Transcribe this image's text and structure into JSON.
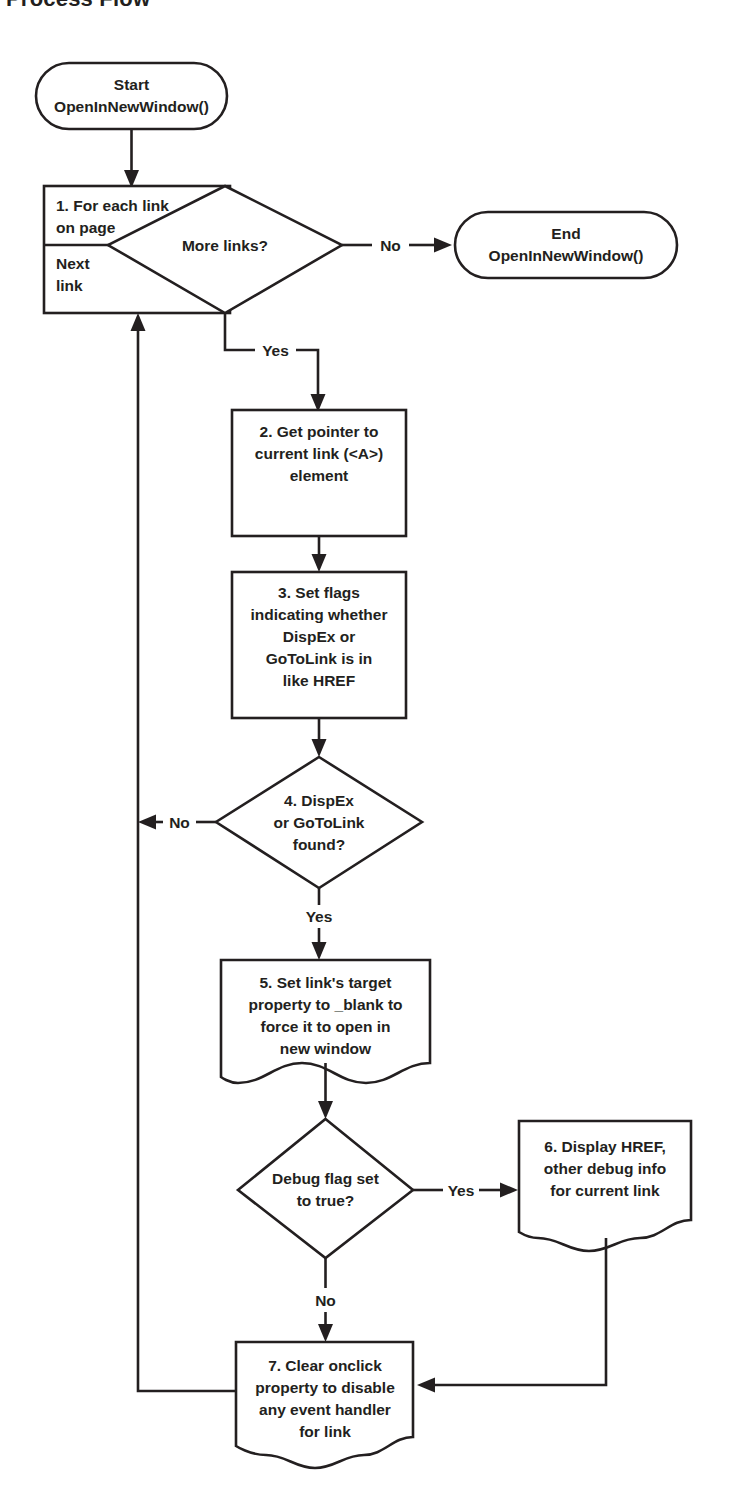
{
  "title": "Process Flow",
  "diagram": {
    "type": "flowchart",
    "orientation": "top-to-bottom",
    "nodes": [
      {
        "id": "start",
        "shape": "terminator",
        "lines": [
          "Start",
          "OpenInNewWindow()"
        ]
      },
      {
        "id": "loop",
        "shape": "loop-box",
        "header_lines": [
          "1. For each link",
          "on page"
        ],
        "footer_lines": [
          "Next",
          "link"
        ]
      },
      {
        "id": "more-links",
        "shape": "decision",
        "lines": [
          "More links?"
        ]
      },
      {
        "id": "end",
        "shape": "terminator",
        "lines": [
          "End",
          "OpenInNewWindow()"
        ]
      },
      {
        "id": "step2",
        "shape": "process",
        "lines": [
          "2. Get pointer to",
          "current link (<A>)",
          "element"
        ]
      },
      {
        "id": "step3",
        "shape": "process",
        "lines": [
          "3. Set flags",
          "indicating whether",
          "DispEx or",
          "GoToLink is in",
          "like HREF"
        ]
      },
      {
        "id": "step4",
        "shape": "decision",
        "lines": [
          "4. DispEx",
          "or GoToLink",
          "found?"
        ]
      },
      {
        "id": "step5",
        "shape": "document",
        "lines": [
          "5. Set link's target",
          "property to _blank to",
          "force it to open in",
          "new window"
        ]
      },
      {
        "id": "debug-flag",
        "shape": "decision",
        "lines": [
          "Debug flag set",
          "to true?"
        ]
      },
      {
        "id": "step6",
        "shape": "document",
        "lines": [
          "6. Display HREF,",
          "other debug info",
          "for current link"
        ]
      },
      {
        "id": "step7",
        "shape": "document",
        "lines": [
          "7. Clear onclick",
          "property to disable",
          "any event handler",
          "for link"
        ]
      }
    ],
    "edges": [
      {
        "id": "e-start-loop",
        "from": "start",
        "to": "loop",
        "label": ""
      },
      {
        "id": "e-more-no",
        "from": "more-links",
        "to": "end",
        "label": "No"
      },
      {
        "id": "e-more-yes",
        "from": "more-links",
        "to": "step2",
        "label": "Yes"
      },
      {
        "id": "e-2-3",
        "from": "step2",
        "to": "step3",
        "label": ""
      },
      {
        "id": "e-3-4",
        "from": "step3",
        "to": "step4",
        "label": ""
      },
      {
        "id": "e-4-no",
        "from": "step4",
        "to": "loop",
        "label": "No"
      },
      {
        "id": "e-4-yes",
        "from": "step4",
        "to": "step5",
        "label": "Yes"
      },
      {
        "id": "e-5-debug",
        "from": "step5",
        "to": "debug-flag",
        "label": ""
      },
      {
        "id": "e-debug-yes",
        "from": "debug-flag",
        "to": "step6",
        "label": "Yes"
      },
      {
        "id": "e-debug-no",
        "from": "debug-flag",
        "to": "step7",
        "label": "No"
      },
      {
        "id": "e-6-7",
        "from": "step6",
        "to": "step7",
        "label": ""
      },
      {
        "id": "e-7-loop",
        "from": "step7",
        "to": "loop",
        "label": ""
      }
    ],
    "colors": {
      "stroke": "#231f20",
      "fill": "#ffffff",
      "background": "#ffffff"
    }
  }
}
